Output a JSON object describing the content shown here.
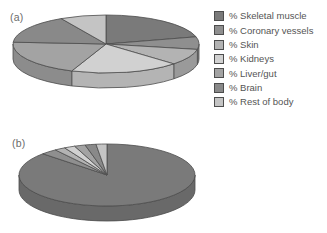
{
  "figure": {
    "background": "#ffffff",
    "outline_color": "#4d4d4d"
  },
  "labels": {
    "chart_a": "(a)",
    "chart_b": "(b)"
  },
  "legend": {
    "position": "right",
    "items": [
      {
        "label": "% Skeletal muscle",
        "color": "#7a7a7a"
      },
      {
        "label": "% Coronary vessels",
        "color": "#8f8f8f"
      },
      {
        "label": "% Skin",
        "color": "#b3b3b3"
      },
      {
        "label": "% Kidneys",
        "color": "#d1d1d1"
      },
      {
        "label": "% Liver/gut",
        "color": "#a3a3a3"
      },
      {
        "label": "% Brain",
        "color": "#898989"
      },
      {
        "label": "% Rest of body",
        "color": "#c4c4c4"
      }
    ]
  },
  "chart_data": [
    {
      "type": "pie",
      "style": "3d",
      "title": "(a)",
      "categories": [
        "% Skeletal muscle",
        "% Coronary vessels",
        "% Skin",
        "% Kidneys",
        "% Liver/gut",
        "% Brain",
        "% Rest of body"
      ],
      "values": [
        21,
        7,
        9,
        19,
        20,
        16,
        8
      ],
      "colors": [
        "#7a7a7a",
        "#8f8f8f",
        "#b3b3b3",
        "#d1d1d1",
        "#a3a3a3",
        "#898989",
        "#c4c4c4"
      ],
      "start_angle_deg_clockwise_from_top": 0,
      "legend_position": "right"
    },
    {
      "type": "pie",
      "style": "3d",
      "title": "(b)",
      "categories": [
        "% Skeletal muscle",
        "% Coronary vessels",
        "% Skin",
        "% Kidneys",
        "% Liver/gut",
        "% Brain",
        "% Rest of body"
      ],
      "values": [
        87,
        3,
        2,
        2,
        2,
        2,
        2
      ],
      "colors": [
        "#7a7a7a",
        "#8f8f8f",
        "#b3b3b3",
        "#d1d1d1",
        "#a3a3a3",
        "#898989",
        "#c4c4c4"
      ],
      "start_angle_deg_clockwise_from_top": 0,
      "legend_position": "right"
    }
  ]
}
